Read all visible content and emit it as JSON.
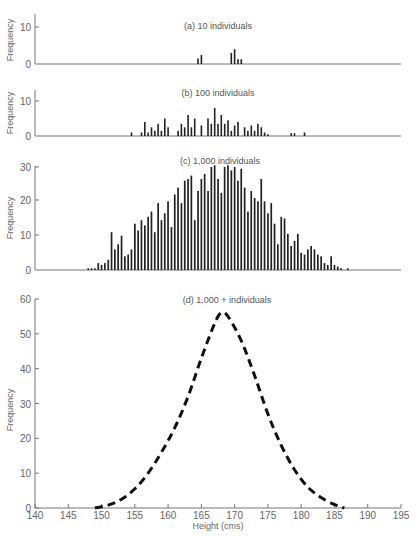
{
  "chart_data": [
    {
      "type": "bar",
      "title": "(a)  10 individuals",
      "xlabel": "",
      "ylabel": "Frequency",
      "ylim": [
        0,
        14
      ],
      "yticks": [
        0,
        10
      ],
      "x": [
        164.5,
        165,
        169.5,
        170,
        170.5,
        171
      ],
      "values": [
        1.5,
        2.5,
        3,
        4,
        1.3,
        1.3
      ]
    },
    {
      "type": "bar",
      "title": "(b)  100 individuals",
      "xlabel": "",
      "ylabel": "Frequency",
      "ylim": [
        0,
        13
      ],
      "yticks": [
        0,
        10
      ],
      "x": [
        154.5,
        156,
        156.5,
        157,
        157.5,
        158,
        158.5,
        159,
        159.5,
        160,
        160.5,
        161.5,
        162,
        162.5,
        163,
        163.5,
        164,
        164.5,
        165,
        166,
        166.5,
        167,
        167.5,
        168,
        168.5,
        169,
        169.5,
        170,
        170.5,
        171.5,
        172,
        172.5,
        173,
        173.5,
        174,
        174.5,
        175,
        175.5,
        176,
        178.5,
        179,
        180.5
      ],
      "values": [
        1,
        1,
        4,
        1,
        2.5,
        1.5,
        3.5,
        1.5,
        5,
        2.5,
        0,
        1.5,
        3.5,
        2.5,
        6,
        2.5,
        5,
        0,
        3,
        5,
        3.5,
        8,
        3.5,
        6,
        3.5,
        4.5,
        1.5,
        3,
        4,
        2.5,
        1.5,
        3,
        1.5,
        3.5,
        2.5,
        1,
        0.5,
        0,
        0,
        0.8,
        0.8,
        1
      ]
    },
    {
      "type": "bar",
      "title": "(c)  1,000 individuals",
      "xlabel": "",
      "ylabel": "Frequency",
      "ylim": [
        0,
        31
      ],
      "yticks": [
        0,
        10,
        20,
        30
      ],
      "x": [
        148,
        148.5,
        149,
        149.5,
        150,
        150.5,
        151,
        151.5,
        152,
        152.5,
        153,
        153.5,
        154,
        154.5,
        155,
        155.5,
        156,
        156.5,
        157,
        157.5,
        158,
        158.5,
        159,
        159.5,
        160,
        160.5,
        161,
        161.5,
        162,
        162.5,
        163,
        163.5,
        164,
        164.5,
        165,
        165.5,
        166,
        166.5,
        167,
        167.5,
        168,
        168.5,
        169,
        169.5,
        170,
        170.5,
        171,
        171.5,
        172,
        172.5,
        173,
        173.5,
        174,
        174.5,
        175,
        175.5,
        176,
        176.5,
        177,
        177.5,
        178,
        178.5,
        179,
        179.5,
        180,
        180.5,
        181,
        181.5,
        182,
        182.5,
        183,
        183.5,
        184,
        184.5,
        185,
        185.5,
        186,
        186.5,
        187
      ],
      "values": [
        0.5,
        0.5,
        0.5,
        2,
        1.5,
        2,
        3,
        11,
        6,
        7.5,
        10,
        4,
        4.5,
        6,
        13.5,
        11.5,
        14.5,
        13,
        15.5,
        17,
        11,
        19.5,
        14.5,
        16.5,
        20,
        12.5,
        22,
        24,
        19.5,
        26,
        26.5,
        27.5,
        14.5,
        23,
        26.5,
        28,
        23,
        30,
        30.5,
        26.5,
        22.5,
        30,
        30.5,
        29,
        30,
        26,
        29.5,
        24,
        17,
        23,
        21,
        20,
        26.5,
        20,
        16.5,
        19.5,
        13.5,
        7.5,
        15.5,
        15,
        10.5,
        7,
        8.5,
        10.5,
        5,
        4.5,
        6,
        7,
        6,
        4.5,
        4,
        2,
        1.5,
        4,
        1.5,
        1,
        0.5,
        0,
        0.5
      ]
    },
    {
      "type": "line",
      "style": "dashed",
      "title": "(d)  1,000 + individuals",
      "xlabel": "Height (cms)",
      "ylabel": "Frequency",
      "xlim": [
        140,
        195
      ],
      "ylim": [
        0,
        60
      ],
      "xticks": [
        140,
        145,
        150,
        155,
        160,
        165,
        170,
        175,
        180,
        185,
        190,
        195
      ],
      "yticks": [
        0,
        10,
        20,
        30,
        40,
        50,
        60
      ],
      "x": [
        149,
        151,
        153,
        155,
        157,
        159,
        161,
        163,
        165,
        167,
        168,
        169,
        171,
        173,
        175,
        177,
        179,
        181,
        183,
        185,
        186.5
      ],
      "values": [
        0,
        0.8,
        2.5,
        5.5,
        10,
        16,
        23,
        32,
        43,
        53,
        56,
        55,
        48,
        38,
        27,
        18,
        11,
        6,
        3,
        1,
        0
      ]
    }
  ],
  "labels": {
    "a_title": "(a)  10 individuals",
    "b_title": "(b)  100 individuals",
    "c_title": "(c)  1,000 individuals",
    "d_title": "(d)  1,000 + individuals",
    "ylabel": "Frequency",
    "xlabel": "Height (cms)"
  }
}
